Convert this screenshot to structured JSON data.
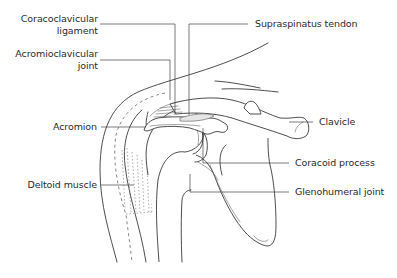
{
  "diagram": {
    "labels": {
      "coracoclavicular_ligament": {
        "line1": "Coracoclavicular",
        "line2": "ligament"
      },
      "acromioclavicular_joint": {
        "line1": "Acromioclavicular",
        "line2": "joint"
      },
      "acromion": "Acromion",
      "deltoid_muscle": "Deltoid muscle",
      "supraspinatus_tendon": "Supraspinatus tendon",
      "clavicle": "Clavicle",
      "coracoid_process": "Coracoid process",
      "glenohumeral_joint": "Glenohumeral joint"
    },
    "colors": {
      "line": "#3a3a3a",
      "text": "#2b2b2b",
      "background": "#ffffff"
    }
  }
}
